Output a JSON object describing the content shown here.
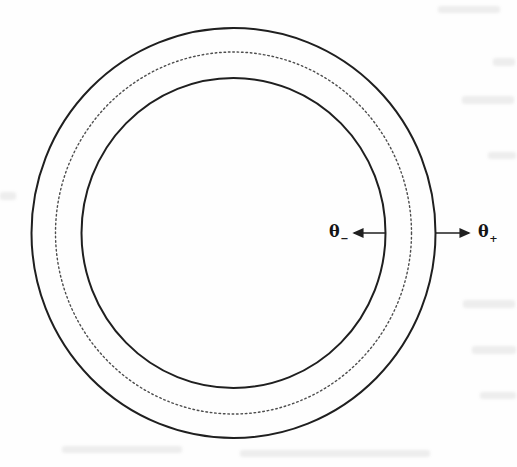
{
  "figure": {
    "labels": {
      "theta_minus": {
        "base": "θ",
        "sub": "−"
      },
      "theta_plus": {
        "base": "θ",
        "sub": "+"
      }
    },
    "colors": {
      "solid_line": "#1f1f1f",
      "dotted_line": "#4d4d4d",
      "background": "#fefefe",
      "label_text": "#151515"
    }
  }
}
